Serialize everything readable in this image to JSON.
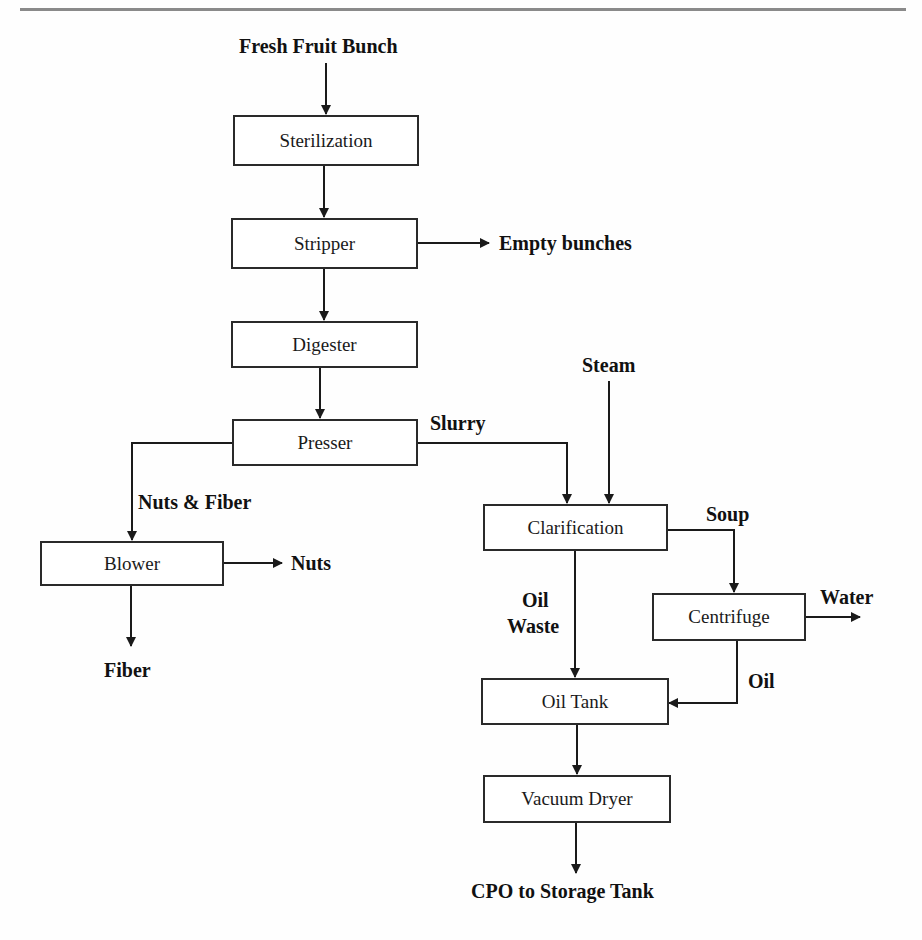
{
  "diagram": {
    "type": "process-flow",
    "title": "",
    "inputs": {
      "fresh_fruit_bunch": "Fresh Fruit Bunch",
      "steam": "Steam"
    },
    "nodes": {
      "sterilization": "Sterilization",
      "stripper": "Stripper",
      "digester": "Digester",
      "presser": "Presser",
      "blower": "Blower",
      "clarification": "Clarification",
      "centrifuge": "Centrifuge",
      "oil_tank": "Oil Tank",
      "vacuum_dryer": "Vacuum Dryer"
    },
    "edge_labels": {
      "empty_bunches": "Empty bunches",
      "slurry": "Slurry",
      "nuts_fiber": "Nuts & Fiber",
      "nuts": "Nuts",
      "fiber": "Fiber",
      "soup": "Soup",
      "water": "Water",
      "oil_waste_1": "Oil",
      "oil_waste_2": "Waste",
      "oil": "Oil",
      "cpo": "CPO to Storage Tank"
    },
    "edges": [
      {
        "from": "Fresh Fruit Bunch",
        "to": "Sterilization"
      },
      {
        "from": "Sterilization",
        "to": "Stripper"
      },
      {
        "from": "Stripper",
        "to": "Empty bunches"
      },
      {
        "from": "Stripper",
        "to": "Digester"
      },
      {
        "from": "Digester",
        "to": "Presser"
      },
      {
        "from": "Presser",
        "to": "Blower",
        "label": "Nuts & Fiber"
      },
      {
        "from": "Presser",
        "to": "Clarification",
        "label": "Slurry"
      },
      {
        "from": "Steam",
        "to": "Clarification"
      },
      {
        "from": "Blower",
        "to": "Nuts"
      },
      {
        "from": "Blower",
        "to": "Fiber"
      },
      {
        "from": "Clarification",
        "to": "Centrifuge",
        "label": "Soup"
      },
      {
        "from": "Clarification",
        "to": "Oil Tank",
        "label": "Oil Waste"
      },
      {
        "from": "Centrifuge",
        "to": "Water"
      },
      {
        "from": "Centrifuge",
        "to": "Oil Tank",
        "label": "Oil"
      },
      {
        "from": "Oil Tank",
        "to": "Vacuum Dryer"
      },
      {
        "from": "Vacuum Dryer",
        "to": "CPO to Storage Tank"
      }
    ],
    "colors": {
      "line": "#1a1a1a",
      "box_border": "#2a2a2a",
      "rule": "#8a8a8a"
    }
  }
}
